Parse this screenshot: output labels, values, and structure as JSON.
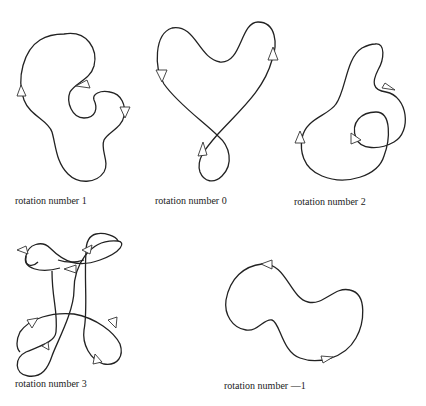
{
  "figures": [
    {
      "id": "fig1",
      "label": "rotation number 1"
    },
    {
      "id": "fig2",
      "label": "rotation number 0"
    },
    {
      "id": "fig3",
      "label": "rotation number 2"
    },
    {
      "id": "fig4",
      "label": "rotation number 3"
    },
    {
      "id": "fig5",
      "label": "rotation number —1"
    }
  ],
  "colors": {
    "stroke": "#222222",
    "background": "#ffffff"
  }
}
